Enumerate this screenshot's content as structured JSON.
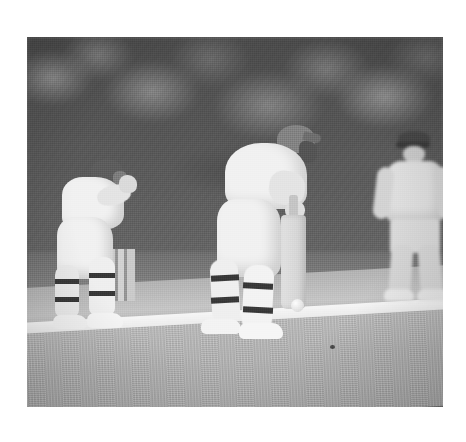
{
  "photo": {
    "kind": "photograph",
    "medium": "black-and-white",
    "subject": "cricket-match",
    "caption": "Black and white photograph of a cricket match: a batsman in whites and helmet defends a delivery while the wicket keeper crouches behind the stumps and a fielder waits in the background.",
    "border_color": "#ffffff",
    "frame": {
      "x": 27,
      "y": 37,
      "width": 416,
      "height": 370
    }
  },
  "scene": {
    "background_label": "blurred dark tree foliage",
    "background_color": "#5a5a5a",
    "midground_label": "darker grass band",
    "midground_color": "#7d7d7d",
    "pitch_label": "cricket pitch strip",
    "pitch_color": "#c2bdb1",
    "crease_label": "white painted crease line",
    "crease_color": "#f2f2ef",
    "outfield_label": "foreground outfield grass",
    "outfield_color": "#b6b6b6",
    "ball_label": "cricket ball",
    "ball_color": "#ededea",
    "speck_label": "dark speck on the grass"
  },
  "players": [
    {
      "role": "wicket-keeper",
      "position": "left, crouched behind the stumps",
      "kit_color": "#efefec",
      "helmet_color": "#6a6a66",
      "pads_color": "#e6e6e1",
      "strap_color": "#3a3a38"
    },
    {
      "role": "batsman",
      "position": "centre, facing the bowler with bat raised in defence",
      "kit_color": "#f1f1ee",
      "helmet_color": "#7d7d78",
      "pads_color": "#e9e9e4",
      "strap_color": "#343432",
      "bat_color": "#ded9cc"
    },
    {
      "role": "fielder",
      "position": "background right, standing in a ready crouch",
      "kit_color": "#dededa",
      "cap_color": "#3f3f3c"
    }
  ],
  "equipment": {
    "bat_label": "cricket bat",
    "stumps_label": "wicket stumps",
    "gloves_label": "wicket-keeping gloves",
    "pads_label": "batting leg pads",
    "shoes_label": "cricket shoes"
  }
}
